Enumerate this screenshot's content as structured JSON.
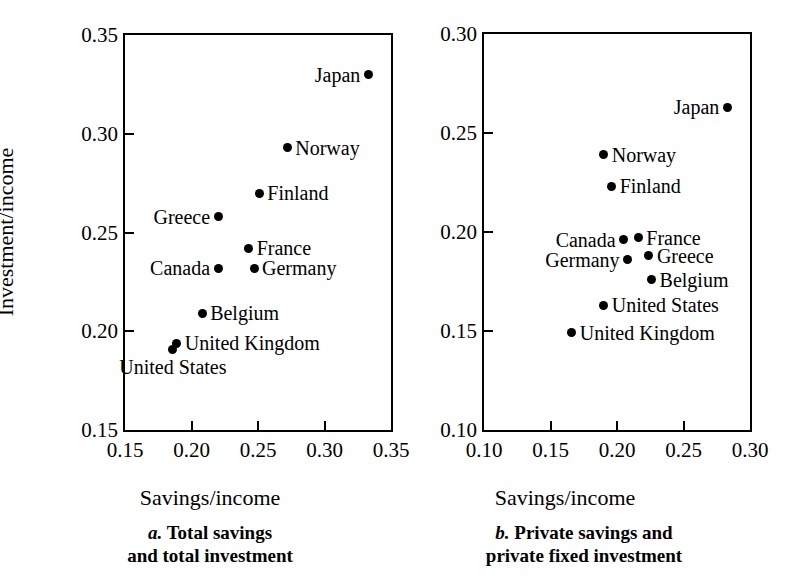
{
  "figure": {
    "panels": [
      {
        "id": "a",
        "caption_letter": "a.",
        "caption_line1": "Total savings",
        "caption_line2": "and total investment",
        "xlabel": "Savings/income",
        "ylabel": "Investment/income",
        "xticks": [
          "0.15",
          "0.20",
          "0.25",
          "0.30",
          "0.35"
        ],
        "yticks": [
          "0.15",
          "0.20",
          "0.25",
          "0.30",
          "0.35"
        ]
      },
      {
        "id": "b",
        "caption_letter": "b.",
        "caption_line1": "Private savings and",
        "caption_line2": "private fixed investment",
        "xlabel": "Savings/income",
        "ylabel": "",
        "xticks": [
          "0.10",
          "0.15",
          "0.20",
          "0.25",
          "0.30"
        ],
        "yticks": [
          "0.10",
          "0.15",
          "0.20",
          "0.25",
          "0.30"
        ]
      }
    ]
  },
  "chart_data": [
    {
      "type": "scatter",
      "title": "a. Total savings and total investment",
      "xlabel": "Savings/income",
      "ylabel": "Investment/income",
      "xlim": [
        0.15,
        0.35
      ],
      "ylim": [
        0.15,
        0.35
      ],
      "xticks": [
        0.15,
        0.2,
        0.25,
        0.3,
        0.35
      ],
      "yticks": [
        0.15,
        0.2,
        0.25,
        0.3,
        0.35
      ],
      "grid": false,
      "legend": "none",
      "marker": "filled-circle",
      "marker_color": "#000000",
      "points": [
        {
          "label": "Japan",
          "x": 0.333,
          "y": 0.33,
          "label_pos": "left"
        },
        {
          "label": "Norway",
          "x": 0.272,
          "y": 0.293,
          "label_pos": "right"
        },
        {
          "label": "Finland",
          "x": 0.251,
          "y": 0.27,
          "label_pos": "right"
        },
        {
          "label": "Greece",
          "x": 0.22,
          "y": 0.258,
          "label_pos": "left"
        },
        {
          "label": "France",
          "x": 0.243,
          "y": 0.242,
          "label_pos": "right"
        },
        {
          "label": "Germany",
          "x": 0.247,
          "y": 0.232,
          "label_pos": "right"
        },
        {
          "label": "Canada",
          "x": 0.22,
          "y": 0.232,
          "label_pos": "left"
        },
        {
          "label": "Belgium",
          "x": 0.208,
          "y": 0.209,
          "label_pos": "right"
        },
        {
          "label": "United Kingdom",
          "x": 0.189,
          "y": 0.194,
          "label_pos": "right"
        },
        {
          "label": "United States",
          "x": 0.186,
          "y": 0.191,
          "label_pos": "below"
        }
      ]
    },
    {
      "type": "scatter",
      "title": "b. Private savings and private fixed investment",
      "xlabel": "Savings/income",
      "ylabel": "",
      "xlim": [
        0.1,
        0.3
      ],
      "ylim": [
        0.1,
        0.3
      ],
      "xticks": [
        0.1,
        0.15,
        0.2,
        0.25,
        0.3
      ],
      "yticks": [
        0.1,
        0.15,
        0.2,
        0.25,
        0.3
      ],
      "grid": false,
      "legend": "none",
      "marker": "filled-circle",
      "marker_color": "#000000",
      "points": [
        {
          "label": "Japan",
          "x": 0.283,
          "y": 0.263,
          "label_pos": "left"
        },
        {
          "label": "Norway",
          "x": 0.19,
          "y": 0.239,
          "label_pos": "right"
        },
        {
          "label": "Finland",
          "x": 0.196,
          "y": 0.223,
          "label_pos": "right"
        },
        {
          "label": "Canada",
          "x": 0.205,
          "y": 0.196,
          "label_pos": "left"
        },
        {
          "label": "France",
          "x": 0.216,
          "y": 0.197,
          "label_pos": "right"
        },
        {
          "label": "Germany",
          "x": 0.208,
          "y": 0.186,
          "label_pos": "left"
        },
        {
          "label": "Greece",
          "x": 0.224,
          "y": 0.188,
          "label_pos": "right"
        },
        {
          "label": "Belgium",
          "x": 0.226,
          "y": 0.176,
          "label_pos": "right"
        },
        {
          "label": "United States",
          "x": 0.19,
          "y": 0.163,
          "label_pos": "right"
        },
        {
          "label": "United Kingdom",
          "x": 0.166,
          "y": 0.149,
          "label_pos": "right"
        }
      ]
    }
  ]
}
